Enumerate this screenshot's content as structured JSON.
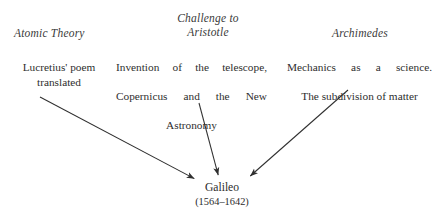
{
  "diagram": {
    "title_node": {
      "name": "Galileo",
      "dates": "(1564–1642)"
    },
    "columns": [
      {
        "heading": "Atomic Theory",
        "body_line1": "Lucretius' poem",
        "body_line2": "translated",
        "body_full": "Lucretius' poem translated"
      },
      {
        "heading": "Challenge to\nAristotle",
        "body_line1": "Invention of the telescope,",
        "body_line2": "Copernicus and the New",
        "body_line3": "Astronomy",
        "body_full": "Invention of the telescope, Copernicus and the New Astronomy"
      },
      {
        "heading": "Archimedes",
        "body_line1": "Mechanics as a science.",
        "body_line2": "The subdivision of matter",
        "body_full": "Mechanics as a science. The subdivision of matter"
      }
    ],
    "arrows": [
      {
        "name": "arrow-atomic-theory-to-galileo",
        "from": [
          40,
          97
        ],
        "to": [
          197,
          180
        ]
      },
      {
        "name": "arrow-challenge-to-galileo",
        "from": [
          199,
          103
        ],
        "to": [
          219,
          178
        ]
      },
      {
        "name": "arrow-archimedes-to-galileo",
        "from": [
          348,
          90
        ],
        "to": [
          248,
          178
        ]
      }
    ],
    "colors": {
      "background": "#ffffff",
      "text": "#2b2b2b",
      "heading_text": "#3a3a3a",
      "arrow": "#2f2f2f"
    }
  }
}
